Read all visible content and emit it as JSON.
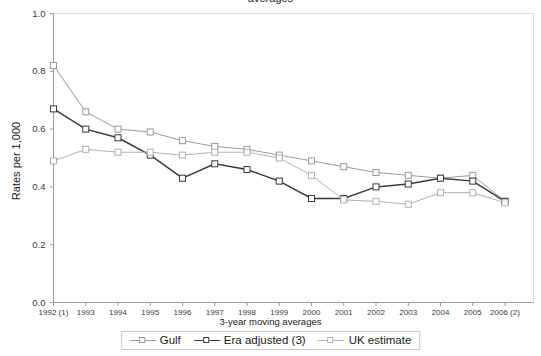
{
  "title_fragment": "averages",
  "axis": {
    "ylabel": "Rates per 1,000",
    "xlabel": "3-year moving averages",
    "yticks": [
      "0.0",
      "0.2",
      "0.4",
      "0.6",
      "0.8",
      "1.0"
    ],
    "xticks": [
      "1992 (1)",
      "1993",
      "1994",
      "1995",
      "1996",
      "1997",
      "1998",
      "1999",
      "2000",
      "2001",
      "2002",
      "2003",
      "2004",
      "2005",
      "2006 (2)"
    ]
  },
  "legend": {
    "items": [
      {
        "label": "Gulf",
        "color": "#9a9a9a"
      },
      {
        "label": "Era adjusted (3)",
        "color": "#3a3a3a"
      },
      {
        "label": "UK estimate",
        "color": "#b0b0b0"
      }
    ]
  },
  "chart_data": {
    "type": "line",
    "title": "",
    "xlabel": "3-year moving averages",
    "ylabel": "Rates per 1,000",
    "ylim": [
      0.0,
      1.0
    ],
    "grid": false,
    "legend_position": "bottom",
    "categories": [
      "1992 (1)",
      "1993",
      "1994",
      "1995",
      "1996",
      "1997",
      "1998",
      "1999",
      "2000",
      "2001",
      "2002",
      "2003",
      "2004",
      "2005",
      "2006 (2)"
    ],
    "series": [
      {
        "name": "Gulf",
        "color": "#9a9a9a",
        "values": [
          0.82,
          0.66,
          0.6,
          0.59,
          0.56,
          0.54,
          0.53,
          0.51,
          0.49,
          0.47,
          0.45,
          0.44,
          0.43,
          0.44,
          0.35
        ]
      },
      {
        "name": "Era adjusted (3)",
        "color": "#3a3a3a",
        "values": [
          0.67,
          0.6,
          0.57,
          0.51,
          0.43,
          0.48,
          0.46,
          0.42,
          0.36,
          0.36,
          0.4,
          0.41,
          0.43,
          0.42,
          0.35
        ]
      },
      {
        "name": "UK estimate",
        "color": "#b0b0b0",
        "values": [
          0.49,
          0.53,
          0.52,
          0.52,
          0.51,
          0.52,
          0.52,
          0.5,
          0.44,
          0.355,
          0.35,
          0.34,
          0.38,
          0.38,
          0.345
        ]
      }
    ]
  }
}
